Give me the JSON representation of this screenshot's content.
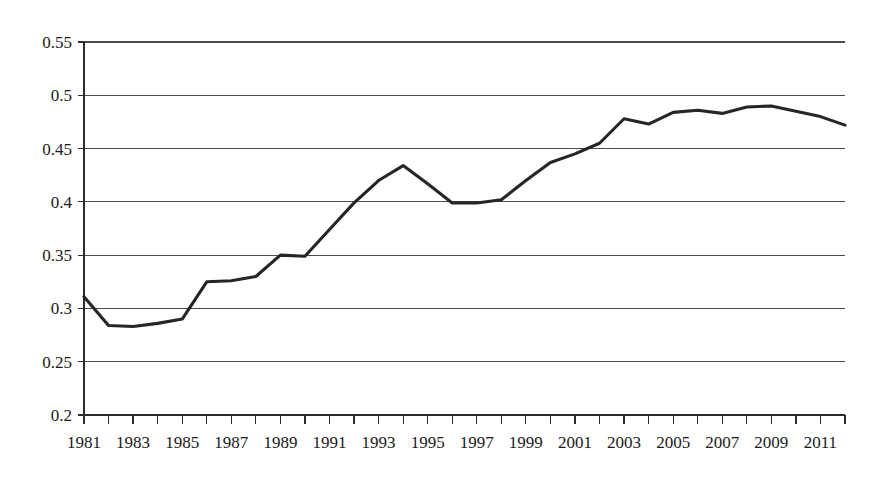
{
  "chart_data": {
    "type": "line",
    "title": "",
    "subtitle": "",
    "xlabel": "",
    "ylabel": "",
    "xlim": [
      1981,
      2012
    ],
    "ylim": [
      0.2,
      0.55
    ],
    "grid": true,
    "legend": null,
    "legend_position": "none",
    "line_color": "#262626",
    "gridline_color": "#4d4d4d",
    "axis_color": "#2b2b2b",
    "y_ticks": [
      0.2,
      0.25,
      0.3,
      0.35,
      0.4,
      0.45,
      0.5,
      0.55
    ],
    "y_tick_labels": [
      "0.2",
      "0.25",
      "0.3",
      "0.35",
      "0.4",
      "0.45",
      "0.5",
      "0.55"
    ],
    "x_tick_years": [
      1981,
      1982,
      1983,
      1984,
      1985,
      1986,
      1987,
      1988,
      1989,
      1990,
      1991,
      1992,
      1993,
      1994,
      1995,
      1996,
      1997,
      1998,
      1999,
      2000,
      2001,
      2002,
      2003,
      2004,
      2005,
      2006,
      2007,
      2008,
      2009,
      2010,
      2011,
      2012
    ],
    "x_tick_labels": [
      "1981",
      "1983",
      "1985",
      "1987",
      "1989",
      "1991",
      "1993",
      "1995",
      "1997",
      "1999",
      "2001",
      "2003",
      "2005",
      "2007",
      "2009",
      "2011"
    ],
    "x_labeled_years": [
      1981,
      1983,
      1985,
      1987,
      1989,
      1991,
      1993,
      1995,
      1997,
      1999,
      2001,
      2003,
      2005,
      2007,
      2009,
      2011
    ],
    "x": [
      1981,
      1982,
      1983,
      1984,
      1985,
      1986,
      1987,
      1988,
      1989,
      1990,
      1991,
      1992,
      1993,
      1994,
      1995,
      1996,
      1997,
      1998,
      1999,
      2000,
      2001,
      2002,
      2003,
      2004,
      2005,
      2006,
      2007,
      2008,
      2009,
      2010,
      2011,
      2012
    ],
    "values": [
      0.311,
      0.284,
      0.283,
      0.286,
      0.29,
      0.325,
      0.326,
      0.33,
      0.35,
      0.349,
      0.374,
      0.399,
      0.42,
      0.434,
      0.417,
      0.399,
      0.399,
      0.402,
      0.42,
      0.437,
      0.445,
      0.455,
      0.478,
      0.473,
      0.484,
      0.486,
      0.483,
      0.489,
      0.49,
      0.485,
      0.48,
      0.472
    ],
    "series": [
      {
        "name": "series-1",
        "values": [
          0.311,
          0.284,
          0.283,
          0.286,
          0.29,
          0.325,
          0.326,
          0.33,
          0.35,
          0.349,
          0.374,
          0.399,
          0.42,
          0.434,
          0.417,
          0.399,
          0.399,
          0.402,
          0.42,
          0.437,
          0.445,
          0.455,
          0.478,
          0.473,
          0.484,
          0.486,
          0.483,
          0.489,
          0.49,
          0.485,
          0.48,
          0.472
        ]
      }
    ]
  }
}
